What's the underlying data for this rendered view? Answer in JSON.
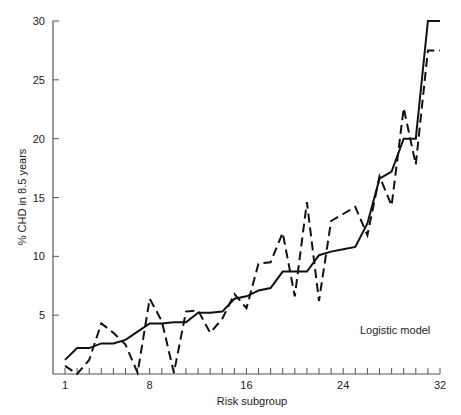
{
  "chart_data": {
    "type": "line",
    "title": "",
    "xlabel": "Risk subgroup",
    "ylabel": "% CHD in 8.5 years",
    "xlim": [
      1,
      32
    ],
    "ylim": [
      0,
      30
    ],
    "x_ticks": [
      1,
      8,
      16,
      24,
      32
    ],
    "y_ticks": [
      5,
      10,
      15,
      20,
      25,
      30
    ],
    "minor_x_ticks_every": 1,
    "grid": false,
    "annotation": "Logistic model",
    "x": [
      1,
      2,
      3,
      4,
      5,
      6,
      7,
      8,
      9,
      10,
      11,
      12,
      13,
      14,
      15,
      16,
      17,
      18,
      19,
      20,
      21,
      22,
      23,
      24,
      25,
      26,
      27,
      28,
      29,
      30,
      31,
      32
    ],
    "series": [
      {
        "name": "Observed",
        "style": "dashed",
        "values": [
          0.7,
          0.0,
          1.2,
          4.3,
          3.5,
          2.5,
          0.1,
          6.4,
          4.5,
          0.1,
          5.3,
          5.4,
          3.5,
          4.7,
          6.8,
          5.6,
          9.4,
          9.5,
          12.0,
          6.6,
          14.6,
          6.2,
          13.0,
          13.6,
          14.2,
          11.8,
          16.8,
          14.3,
          22.6,
          17.8,
          27.5,
          27.5
        ]
      },
      {
        "name": "Logistic model",
        "style": "solid",
        "values": [
          1.2,
          2.2,
          2.2,
          2.6,
          2.6,
          2.9,
          3.6,
          4.3,
          4.3,
          4.4,
          4.4,
          5.2,
          5.2,
          5.3,
          6.4,
          6.6,
          7.1,
          7.3,
          8.7,
          8.7,
          8.7,
          10.1,
          10.4,
          10.6,
          10.8,
          12.8,
          16.6,
          17.2,
          20.0,
          20.0,
          30.0,
          30.0
        ]
      }
    ],
    "colors": {
      "line": "#111111",
      "axis": "#555555",
      "text": "#222222"
    }
  }
}
